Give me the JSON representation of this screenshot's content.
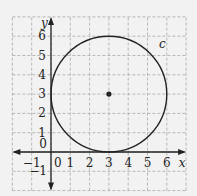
{
  "chart_data": {
    "type": "scatter",
    "title": "",
    "xlabel": "x",
    "ylabel": "y",
    "xlim": [
      -2,
      7
    ],
    "ylim": [
      -2,
      7
    ],
    "grid": true,
    "grid_style": "dashed",
    "x_ticks": [
      "-1",
      "0",
      "1",
      "2",
      "3",
      "4",
      "5",
      "6"
    ],
    "y_ticks": [
      "-1",
      "0",
      "1",
      "2",
      "3",
      "4",
      "5",
      "6"
    ],
    "circle": {
      "label": "c",
      "center": [
        3,
        3
      ],
      "radius": 3
    },
    "points": [
      {
        "x": 3,
        "y": 3,
        "label": "center"
      }
    ],
    "annotations": [
      {
        "text": "c",
        "x": 5.6,
        "y": 5.6
      }
    ]
  },
  "axes": {
    "x_label": "x",
    "y_label": "y",
    "x_tick_labels": [
      "−1",
      "0",
      "1",
      "2",
      "3",
      "4",
      "5",
      "6"
    ],
    "y_tick_labels": [
      "−1",
      "0",
      "1",
      "2",
      "3",
      "4",
      "5",
      "6"
    ]
  },
  "curve_label": "c",
  "colors": {
    "background": "#f2f2f2",
    "grid": "#a8a8a8",
    "ink": "#222222"
  }
}
